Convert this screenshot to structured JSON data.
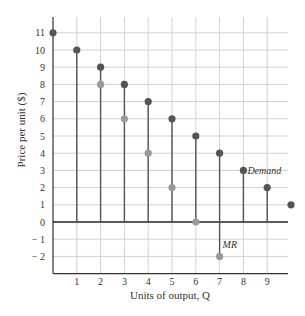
{
  "chart_data": {
    "type": "scatter",
    "title": "",
    "xlabel": "Units of output, Q",
    "ylabel": "Price per unit ($)",
    "xlim": [
      0,
      10
    ],
    "ylim": [
      -3,
      11.9
    ],
    "x_ticks": [
      1,
      2,
      3,
      4,
      5,
      6,
      7,
      8,
      9
    ],
    "y_ticks": [
      -2,
      -1,
      0,
      1,
      2,
      3,
      4,
      5,
      6,
      7,
      8,
      9,
      10,
      11
    ],
    "y_tick_labels": [
      "− 2",
      "− 1",
      "0",
      "1",
      "2",
      "3",
      "4",
      "5",
      "6",
      "7",
      "8",
      "9",
      "10",
      "11"
    ],
    "grid": true,
    "series": [
      {
        "name": "Demand",
        "x": [
          0,
          1,
          2,
          3,
          4,
          5,
          6,
          7,
          8,
          9,
          10
        ],
        "values": [
          11,
          10,
          9,
          8,
          7,
          6,
          5,
          4,
          3,
          2,
          1
        ],
        "color": "#555555",
        "label_at": {
          "x": 8,
          "y": 3
        }
      },
      {
        "name": "MR",
        "x": [
          2,
          3,
          4,
          5,
          6,
          7
        ],
        "values": [
          8,
          6,
          4,
          2,
          0,
          -2
        ],
        "color": "#9a9a9a",
        "label_at": {
          "x": 7,
          "y": -2
        }
      }
    ],
    "stems": {
      "description": "Vertical lines from 0 to each demand point for Q=1..9; stem at Q=7 extends down to MR=-2",
      "x": [
        1,
        2,
        3,
        4,
        5,
        6,
        7,
        8,
        9
      ],
      "from": [
        0,
        0,
        0,
        0,
        0,
        0,
        -2,
        0,
        0
      ],
      "to": [
        10,
        9,
        8,
        7,
        6,
        5,
        4,
        3,
        2
      ]
    },
    "colors": {
      "grid": "#d0d0d0",
      "axis": "#333333",
      "stem": "#555555"
    }
  }
}
